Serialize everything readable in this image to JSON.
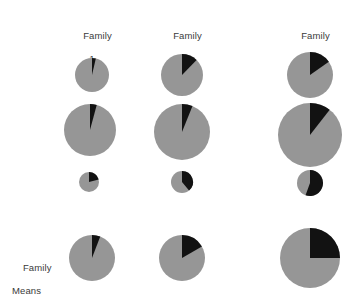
{
  "figure": {
    "title": "",
    "background_color": "#ffffff",
    "column_headers": [
      {
        "line1": "Family",
        "line2": "1"
      },
      {
        "line1": "Family",
        "line2": "2"
      },
      {
        "line1": "Family",
        "line2": "3"
      }
    ],
    "row_label_means": {
      "line1": "Family",
      "line2": "Means"
    }
  },
  "chart_data": {
    "type": "pie",
    "title": "",
    "subtitle": "",
    "xlabel": "",
    "ylabel": "",
    "grid": false,
    "legend_position": "none",
    "colors": {
      "slice_gray": "#969696",
      "slice_black": "#121212",
      "background": "#ffffff",
      "text": "#3a3a3a"
    },
    "slice_labels": [
      "gray",
      "black"
    ],
    "start_angle_deg": 0,
    "direction": "clockwise",
    "columns": [
      "Family 1",
      "Family 2",
      "Family 3"
    ],
    "rows": [
      "Individual 1",
      "Individual 2",
      "Individual 3",
      "Family Means"
    ],
    "pies": [
      {
        "row": 0,
        "col": 0,
        "cx": 92,
        "cy": 75,
        "r": 17,
        "black_fraction": 0.036,
        "black_angle_deg": 13
      },
      {
        "row": 0,
        "col": 1,
        "cx": 182,
        "cy": 75,
        "r": 21,
        "black_fraction": 0.122,
        "black_angle_deg": 44
      },
      {
        "row": 0,
        "col": 2,
        "cx": 310,
        "cy": 75,
        "r": 23,
        "black_fraction": 0.153,
        "black_angle_deg": 55
      },
      {
        "row": 1,
        "col": 0,
        "cx": 90,
        "cy": 130,
        "r": 26,
        "black_fraction": 0.042,
        "black_angle_deg": 15
      },
      {
        "row": 1,
        "col": 1,
        "cx": 182,
        "cy": 132,
        "r": 28,
        "black_fraction": 0.061,
        "black_angle_deg": 22
      },
      {
        "row": 1,
        "col": 2,
        "cx": 310,
        "cy": 135,
        "r": 32,
        "black_fraction": 0.106,
        "black_angle_deg": 38
      },
      {
        "row": 2,
        "col": 0,
        "cx": 89,
        "cy": 182,
        "r": 10,
        "black_fraction": 0.208,
        "black_angle_deg": 75
      },
      {
        "row": 2,
        "col": 1,
        "cx": 182,
        "cy": 182,
        "r": 11,
        "black_fraction": 0.389,
        "black_angle_deg": 140
      },
      {
        "row": 2,
        "col": 2,
        "cx": 310,
        "cy": 183,
        "r": 13,
        "black_fraction": 0.556,
        "black_angle_deg": 200
      },
      {
        "row": 3,
        "col": 0,
        "cx": 92,
        "cy": 258,
        "r": 23,
        "black_fraction": 0.058,
        "black_angle_deg": 21
      },
      {
        "row": 3,
        "col": 1,
        "cx": 182,
        "cy": 258,
        "r": 23,
        "black_fraction": 0.167,
        "black_angle_deg": 60
      },
      {
        "row": 3,
        "col": 2,
        "cx": 310,
        "cy": 258,
        "r": 30,
        "black_fraction": 0.25,
        "black_angle_deg": 90
      }
    ]
  }
}
